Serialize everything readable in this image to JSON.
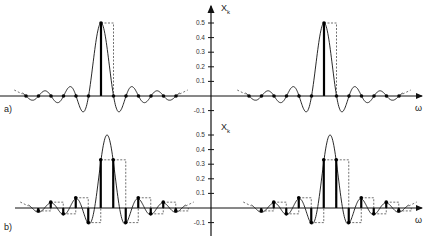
{
  "figure": {
    "panel_a": {
      "label": "a)"
    },
    "panel_b": {
      "label": "b)"
    },
    "y_axis_label": "X",
    "y_axis_subscript": "k",
    "x_axis_label": "ω",
    "y_ticks": [
      "0.5",
      "0.4",
      "0.3",
      "0.2",
      "0.1",
      "-0.1"
    ]
  },
  "chart_data": [
    {
      "type": "line",
      "title": "a) sinc spectrum sampled at zero crossings",
      "xlabel": "ω",
      "ylabel": "X_k",
      "ylim": [
        -0.1,
        0.5
      ],
      "y_ticks": [
        -0.1,
        0.1,
        0.2,
        0.3,
        0.4,
        0.5
      ],
      "series": [
        {
          "name": "continuous spectrum",
          "shape": "sinc, peak 0.5, periodic copies"
        },
        {
          "name": "samples X_k",
          "values": [
            0,
            0,
            0,
            0,
            0,
            0,
            0.5,
            0,
            0,
            0,
            0,
            0,
            0
          ]
        }
      ]
    },
    {
      "type": "line",
      "title": "b) sinc spectrum sampled offset by half bin",
      "xlabel": "ω",
      "ylabel": "X_k",
      "ylim": [
        -0.1,
        0.5
      ],
      "y_ticks": [
        -0.1,
        0.1,
        0.2,
        0.3,
        0.4,
        0.5
      ],
      "series": [
        {
          "name": "continuous spectrum",
          "shape": "sinc, peak 0.5, periodic copies"
        },
        {
          "name": "samples X_k",
          "values": [
            -0.02,
            0.04,
            -0.04,
            0.07,
            -0.1,
            0.33,
            0.33,
            -0.1,
            0.07,
            -0.04,
            0.04,
            -0.02
          ]
        }
      ]
    }
  ]
}
